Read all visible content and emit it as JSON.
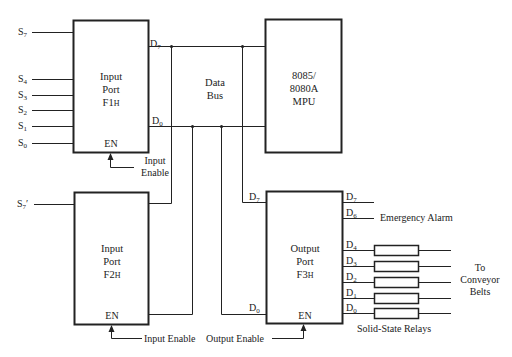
{
  "diagram": {
    "blocks": {
      "input_port_f1": {
        "line1": "Input",
        "line2": "Port",
        "line3_main": "F1",
        "line3_suffix": "H",
        "en": "EN"
      },
      "input_port_f2": {
        "line1": "Input",
        "line2": "Port",
        "line3_main": "F2",
        "line3_suffix": "H",
        "en": "EN"
      },
      "mpu": {
        "line1": "8085/",
        "line2": "8080A",
        "line3": "MPU"
      },
      "output_port_f3": {
        "line1": "Output",
        "line2": "Port",
        "line3_main": "F3",
        "line3_suffix": "H",
        "en": "EN"
      }
    },
    "data_bus": {
      "line1": "Data",
      "line2": "Bus"
    },
    "f1_inputs": [
      {
        "base": "S",
        "sub": "7"
      },
      {
        "base": "S",
        "sub": "4"
      },
      {
        "base": "S",
        "sub": "3"
      },
      {
        "base": "S",
        "sub": "2"
      },
      {
        "base": "S",
        "sub": "1"
      },
      {
        "base": "S",
        "sub": "0"
      }
    ],
    "f2_input": {
      "base": "S",
      "sub": "7",
      "prime": "′"
    },
    "pins": {
      "d7": {
        "base": "D",
        "sub": "7"
      },
      "d6": {
        "base": "D",
        "sub": "6"
      },
      "d4": {
        "base": "D",
        "sub": "4"
      },
      "d3": {
        "base": "D",
        "sub": "3"
      },
      "d2": {
        "base": "D",
        "sub": "2"
      },
      "d1": {
        "base": "D",
        "sub": "1"
      },
      "d0": {
        "base": "D",
        "sub": "0"
      }
    },
    "labels": {
      "f1_enable_line1": "Input",
      "f1_enable_line2": "Enable",
      "f2_enable": "Input Enable",
      "f3_enable": "Output Enable",
      "emergency_alarm": "Emergency Alarm",
      "conveyor_line1": "To",
      "conveyor_line2": "Conveyor",
      "conveyor_line3": "Belts",
      "relays": "Solid-State Relays"
    },
    "colors": {
      "line": "#222222",
      "background": "#ffffff"
    }
  }
}
